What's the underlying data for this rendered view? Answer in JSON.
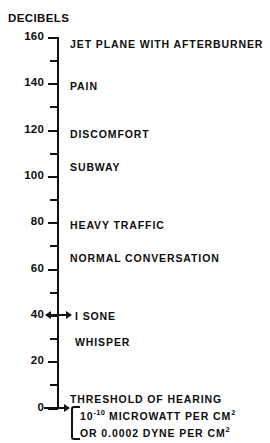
{
  "chart_data": {
    "type": "bar",
    "title": "DECIBELS",
    "orientation": "vertical-scale",
    "axis_label": "DECIBELS",
    "xlabel": "",
    "ylabel": "DECIBELS",
    "ylim": [
      0,
      160
    ],
    "grid": false,
    "legend": null,
    "major_tick_step": 20,
    "minor_tick_step": 10,
    "tick_labels": [
      "160",
      "140",
      "120",
      "100",
      "80",
      "60",
      "40",
      "20",
      "0"
    ],
    "tick_values": [
      160,
      140,
      120,
      100,
      80,
      60,
      40,
      20,
      0
    ],
    "minor_tick_values": [
      150,
      130,
      110,
      90,
      70,
      50,
      30,
      10
    ],
    "categories": [
      "JET PLANE WITH AFTERBURNER",
      "PAIN",
      "DISCOMFORT",
      "SUBWAY",
      "HEAVY TRAFFIC",
      "NORMAL CONVERSATION",
      "I SONE",
      "WHISPER",
      "THRESHOLD OF HEARING"
    ],
    "values": [
      160,
      140,
      120,
      105,
      80,
      65,
      40,
      30,
      0
    ],
    "annotations": [
      "10-10 MICROWATT PER CM2",
      "OR 0.0002 DYNE PER CM2"
    ]
  },
  "axis": {
    "title": "DECIBELS",
    "ticks": [
      {
        "label": "160",
        "value": 160,
        "major": true,
        "top": 37
      },
      {
        "label": "",
        "value": 150,
        "major": false,
        "top": 60
      },
      {
        "label": "140",
        "value": 140,
        "major": true,
        "top": 83
      },
      {
        "label": "",
        "value": 130,
        "major": false,
        "top": 106
      },
      {
        "label": "120",
        "value": 120,
        "major": true,
        "top": 130
      },
      {
        "label": "",
        "value": 110,
        "major": false,
        "top": 153
      },
      {
        "label": "100",
        "value": 100,
        "major": true,
        "top": 176
      },
      {
        "label": "",
        "value": 90,
        "major": false,
        "top": 199
      },
      {
        "label": "80",
        "value": 80,
        "major": true,
        "top": 222
      },
      {
        "label": "",
        "value": 70,
        "major": false,
        "top": 245
      },
      {
        "label": "60",
        "value": 60,
        "major": true,
        "top": 269
      },
      {
        "label": "",
        "value": 50,
        "major": false,
        "top": 292
      },
      {
        "label": "40",
        "value": 40,
        "major": true,
        "top": 315
      },
      {
        "label": "",
        "value": 30,
        "major": false,
        "top": 338
      },
      {
        "label": "20",
        "value": 20,
        "major": true,
        "top": 361
      },
      {
        "label": "",
        "value": 10,
        "major": false,
        "top": 384
      },
      {
        "label": "0",
        "value": 0,
        "major": true,
        "top": 408
      }
    ]
  },
  "levels": [
    {
      "text": "JET PLANE WITH AFTERBURNER",
      "top": 38,
      "left": 70
    },
    {
      "text": "PAIN",
      "top": 80,
      "left": 70
    },
    {
      "text": "DISCOMFORT",
      "top": 128,
      "left": 70
    },
    {
      "text": "SUBWAY",
      "top": 161,
      "left": 70
    },
    {
      "text": "HEAVY TRAFFIC",
      "top": 219,
      "left": 70
    },
    {
      "text": "NORMAL CONVERSATION",
      "top": 252,
      "left": 70
    },
    {
      "text": "I SONE",
      "top": 310,
      "left": 75
    },
    {
      "text": "WHISPER",
      "top": 336,
      "left": 75
    }
  ],
  "threshold": {
    "line1": "THRESHOLD OF HEARING",
    "line2_prefix": "10",
    "line2_exp": "-10",
    "line2_mid": " MICROWATT PER CM",
    "line2_sup": "2",
    "line3_prefix": "OR 0.0002 DYNE PER CM",
    "line3_sup": "2"
  },
  "colors": {
    "ink": "#111111",
    "background": "#ffffff"
  }
}
